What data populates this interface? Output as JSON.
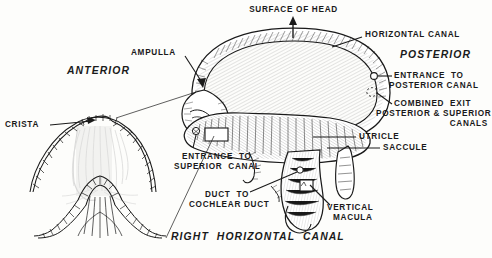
{
  "figure": {
    "title": "RIGHT HORIZONTAL CANAL",
    "type": "anatomical-line-diagram",
    "ink_color": "#1a1a1a",
    "paper_color": "#fdfdfb"
  },
  "orientation_labels": {
    "anterior": "ANTERIOR",
    "posterior": "POSTERIOR",
    "surface_of_head": "SURFACE OF HEAD"
  },
  "labels": {
    "surface_of_head": "SURFACE OF HEAD",
    "horizontal_canal": "HORIZONTAL CANAL",
    "posterior": "POSTERIOR",
    "anterior": "ANTERIOR",
    "ampulla": "AMPULLA",
    "crista": "CRISTA",
    "entrance_to_posterior_canal_line1": "ENTRANCE  TO",
    "entrance_to_posterior_canal_line2": "POSTERIOR CANAL",
    "combined_exit_line1": "COMBINED  EXIT",
    "combined_exit_line2": "POSTERIOR & SUPERIOR",
    "combined_exit_line3": "CANALS",
    "utricle": "UTRICLE",
    "saccule": "SACCULE",
    "entrance_to_superior_canal_line1": "ENTRANCE  TO",
    "entrance_to_superior_canal_line2": "SUPERIOR  CANAL",
    "duct_to_cochlear_duct_line1": "DUCT  TO",
    "duct_to_cochlear_duct_line2": "COCHLEAR DUCT",
    "vertical_macula_line1": "VERTICAL",
    "vertical_macula_line2": "MACULA",
    "caption": "RIGHT  HORIZONTAL  CANAL"
  },
  "parts": [
    {
      "name": "horizontal-canal",
      "label": "HORIZONTAL CANAL"
    },
    {
      "name": "ampulla",
      "label": "AMPULLA"
    },
    {
      "name": "crista",
      "label": "CRISTA"
    },
    {
      "name": "utricle",
      "label": "UTRICLE"
    },
    {
      "name": "saccule",
      "label": "SACCULE"
    },
    {
      "name": "vertical-macula",
      "label": "VERTICAL MACULA"
    },
    {
      "name": "entrance-to-posterior-canal",
      "label": "ENTRANCE TO POSTERIOR CANAL"
    },
    {
      "name": "combined-exit-posterior-superior-canals",
      "label": "COMBINED EXIT POSTERIOR & SUPERIOR CANALS"
    },
    {
      "name": "entrance-to-superior-canal",
      "label": "ENTRANCE TO SUPERIOR CANAL"
    },
    {
      "name": "duct-to-cochlear-duct",
      "label": "DUCT TO COCHLEAR DUCT"
    }
  ]
}
